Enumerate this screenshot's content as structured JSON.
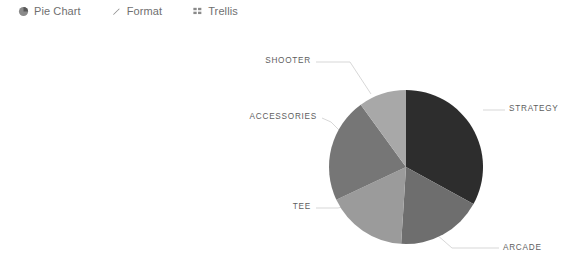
{
  "toolbar": {
    "items": [
      {
        "label": "Pie Chart",
        "icon": "pie-chart-icon"
      },
      {
        "label": "Format",
        "icon": "pencil-icon"
      },
      {
        "label": "Trellis",
        "icon": "grid-icon"
      }
    ]
  },
  "chart_data": {
    "type": "pie",
    "title": "",
    "categories": [
      "STRATEGY",
      "ARCADE",
      "TEE",
      "ACCESSORIES",
      "SHOOTER"
    ],
    "values": [
      33,
      18,
      17,
      22,
      10
    ],
    "colors": [
      "#2d2d2d",
      "#6e6e6e",
      "#9b9b9b",
      "#767676",
      "#a8a8a8"
    ],
    "labels": [
      {
        "name": "STRATEGY",
        "value": 33,
        "color": "#2d2d2d",
        "anchor": "start",
        "text_x": 509,
        "text_y": 89,
        "leader": "M 483 88 L 494 88 L 505 88"
      },
      {
        "name": "ARCADE",
        "value": 18,
        "color": "#6e6e6e",
        "anchor": "start",
        "text_x": 503,
        "text_y": 228,
        "leader": "M 428 205 L 452 226 L 499 226"
      },
      {
        "name": "TEE",
        "value": 17,
        "color": "#9b9b9b",
        "anchor": "end",
        "text_x": 311,
        "text_y": 187,
        "leader": "M 347 184 L 338 186 L 316 186"
      },
      {
        "name": "ACCESSORIES",
        "value": 22,
        "color": "#767676",
        "anchor": "end",
        "text_x": 317,
        "text_y": 97,
        "leader": "M 341 110 L 331 100 L 322 96"
      },
      {
        "name": "SHOOTER",
        "value": 10,
        "color": "#a8a8a8",
        "anchor": "end",
        "text_x": 311,
        "text_y": 41,
        "leader": "M 371 72 L 350 40 L 316 40"
      }
    ],
    "center_x": 406,
    "center_y": 145,
    "radius": 77,
    "start_angle": 0,
    "direction": "clockwise",
    "legend": "none",
    "grid": false
  }
}
